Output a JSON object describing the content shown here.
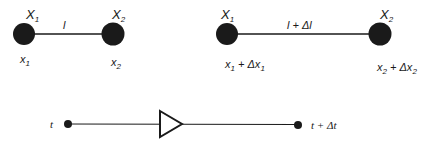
{
  "diagram": {
    "colors": {
      "ink": "#1a1a1a",
      "background": "#ffffff"
    },
    "panel_a": {
      "node_left": {
        "label_top": "X",
        "label_top_sub": "1",
        "label_bottom": "x",
        "label_bottom_sub": "1"
      },
      "node_right": {
        "label_top": "X",
        "label_top_sub": "2",
        "label_bottom": "x",
        "label_bottom_sub": "2"
      },
      "edge_label": "l"
    },
    "panel_b": {
      "node_left": {
        "label_top": "X",
        "label_top_sub": "1",
        "label_bottom": "x",
        "label_bottom_sub": "1",
        "label_bottom_suffix": " + Δx",
        "label_bottom_suffix_sub": "1"
      },
      "node_right": {
        "label_top": "X",
        "label_top_sub": "2",
        "label_bottom": "x",
        "label_bottom_sub": "2",
        "label_bottom_suffix": " + Δx",
        "label_bottom_suffix_sub": "2"
      },
      "edge_label": "l + Δl"
    },
    "panel_c": {
      "start_label": "t",
      "end_label": "t + Δt",
      "arrow": "triangle-right"
    }
  }
}
